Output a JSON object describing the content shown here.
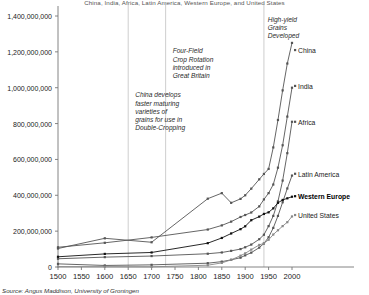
{
  "subtitle": "China, India, Africa, Latin America, Western Europe, and United States",
  "source": "Source: Angus Maddison, University of Groningen",
  "chart_data": {
    "type": "line",
    "title": "",
    "subtitle": "China, India, Africa, Latin America, Western Europe, and United States",
    "xlabel": "",
    "ylabel": "",
    "xlim": [
      1500,
      2000
    ],
    "ylim": [
      0,
      1400000000
    ],
    "grid": false,
    "legend_position": "right-inline",
    "xticks": [
      1500,
      1550,
      1600,
      1650,
      1700,
      1750,
      1800,
      1850,
      1900,
      1950,
      2000
    ],
    "xtick_labels": [
      "1500",
      "1550",
      "1600",
      "1650",
      "1700",
      "1750",
      "1800",
      "1850",
      "1900",
      "1950",
      "2000"
    ],
    "yticks": [
      0,
      200000000,
      400000000,
      600000000,
      800000000,
      1000000000,
      1200000000,
      1400000000
    ],
    "ytick_labels": [
      "0",
      "200,000,000",
      "400,000,000",
      "600,000,000",
      "800,000,000",
      "1,000,000,000",
      "1,200,000,000",
      "1,400,000,000"
    ],
    "vlines": [
      {
        "x": 1650,
        "label": "china-double-cropping-line"
      },
      {
        "x": 1730,
        "label": "four-field-rotation-line"
      },
      {
        "x": 1940,
        "label": "high-yield-grains-line"
      }
    ],
    "annotations": [
      {
        "name": "china-double-cropping",
        "lines": [
          "China develops",
          "faster maturing",
          "varieties of",
          "grains for use in",
          "Double-Cropping"
        ],
        "x": 1665,
        "y": 980000000
      },
      {
        "name": "four-field-rotation",
        "lines": [
          "Four-Field",
          "Crop Rotation",
          "introduced in",
          "Great Britain"
        ],
        "x": 1745,
        "y": 1225000000
      },
      {
        "name": "high-yield-grains",
        "lines": [
          "High-yield",
          "Grains",
          "Developed"
        ],
        "x": 1948,
        "y": 1400000000
      }
    ],
    "series": [
      {
        "name": "China",
        "color": "#555555",
        "label_y": 1210000000,
        "x": [
          1500,
          1600,
          1700,
          1820,
          1850,
          1870,
          1890,
          1900,
          1913,
          1930,
          1940,
          1950,
          1960,
          1970,
          1980,
          1990,
          2000
        ],
        "values": [
          103000000,
          160000000,
          138000000,
          381000000,
          412000000,
          358000000,
          380000000,
          400000000,
          437000000,
          489000000,
          519000000,
          547000000,
          667000000,
          820000000,
          985000000,
          1135000000,
          1250000000
        ]
      },
      {
        "name": "India",
        "color": "#555555",
        "label_y": 1010000000,
        "x": [
          1500,
          1600,
          1700,
          1820,
          1850,
          1870,
          1890,
          1900,
          1913,
          1930,
          1940,
          1950,
          1960,
          1970,
          1980,
          1990,
          2000
        ],
        "values": [
          110000000,
          135000000,
          165000000,
          209000000,
          232000000,
          253000000,
          279000000,
          290000000,
          304000000,
          338000000,
          377000000,
          412000000,
          460000000,
          554000000,
          679000000,
          839000000,
          1000000000
        ]
      },
      {
        "name": "Africa",
        "color": "#555555",
        "label_y": 810000000,
        "x": [
          1500,
          1600,
          1700,
          1820,
          1850,
          1870,
          1890,
          1900,
          1913,
          1930,
          1940,
          1950,
          1960,
          1970,
          1980,
          1990,
          2000
        ],
        "values": [
          46000000,
          55000000,
          61000000,
          74000000,
          81000000,
          90000000,
          100000000,
          110000000,
          125000000,
          155000000,
          180000000,
          228000000,
          285000000,
          366000000,
          482000000,
          635000000,
          810000000
        ]
      },
      {
        "name": "Latin America",
        "color": "#555555",
        "label_y": 520000000,
        "x": [
          1500,
          1600,
          1700,
          1820,
          1850,
          1870,
          1890,
          1900,
          1913,
          1930,
          1940,
          1950,
          1960,
          1970,
          1980,
          1990,
          2000
        ],
        "values": [
          17500000,
          8600000,
          12000000,
          21200000,
          30000000,
          40000000,
          52000000,
          65000000,
          80000000,
          108000000,
          131000000,
          166000000,
          218000000,
          285000000,
          361000000,
          438000000,
          510000000
        ]
      },
      {
        "name": "Western Europe",
        "color": "#111111",
        "label_y": 395000000,
        "bold": true,
        "x": [
          1500,
          1600,
          1700,
          1820,
          1850,
          1870,
          1890,
          1900,
          1913,
          1930,
          1940,
          1950,
          1960,
          1970,
          1980,
          1990,
          2000
        ],
        "values": [
          57000000,
          73000000,
          81000000,
          133000000,
          162000000,
          187000000,
          211000000,
          227000000,
          261000000,
          281000000,
          296000000,
          305000000,
          327000000,
          358000000,
          374000000,
          383000000,
          392000000
        ]
      },
      {
        "name": "United States",
        "color": "#888888",
        "label_y": 290000000,
        "x": [
          1500,
          1600,
          1700,
          1820,
          1850,
          1870,
          1890,
          1900,
          1913,
          1930,
          1940,
          1950,
          1960,
          1970,
          1980,
          1990,
          2000
        ],
        "values": [
          2000000,
          1500000,
          1000000,
          10000000,
          23000000,
          40000000,
          63000000,
          76000000,
          97000000,
          123000000,
          132000000,
          152000000,
          181000000,
          205000000,
          228000000,
          250000000,
          282000000
        ]
      }
    ]
  }
}
